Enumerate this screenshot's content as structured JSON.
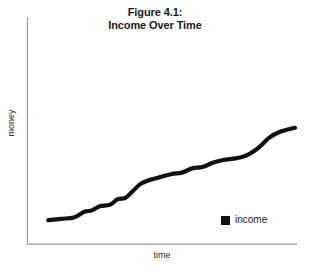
{
  "chart_data": {
    "type": "line",
    "title": "Figure 4.1:\nIncome Over Time",
    "title_lines": [
      "Figure 4.1:",
      "Income Over Time"
    ],
    "xlabel": "time",
    "ylabel": "money",
    "grid": false,
    "legend_position": "bottom-right",
    "xlim": [
      0,
      100
    ],
    "ylim": [
      0,
      100
    ],
    "axis_ticks": {
      "x": [],
      "y": []
    },
    "series": [
      {
        "name": "income",
        "color": "#111111",
        "x": [
          4,
          9,
          14,
          18,
          21,
          24,
          28,
          31,
          34,
          37,
          40,
          44,
          48,
          52,
          56,
          60,
          64,
          68,
          72,
          76,
          79,
          82,
          86,
          90,
          94,
          100
        ],
        "values": [
          17,
          18,
          19,
          23,
          24,
          27,
          28,
          32,
          33,
          38,
          43,
          46,
          48,
          50,
          51,
          54,
          55,
          58,
          60,
          61,
          62,
          64,
          69,
          76,
          80,
          83
        ]
      }
    ],
    "legend": [
      {
        "label": "income",
        "color": "#111111",
        "marker": "square"
      }
    ],
    "annotations": []
  },
  "axes": {
    "line_color": "#9b9b9b",
    "y_axis_name": "y-axis-line",
    "x_axis_name": "x-axis-line"
  }
}
